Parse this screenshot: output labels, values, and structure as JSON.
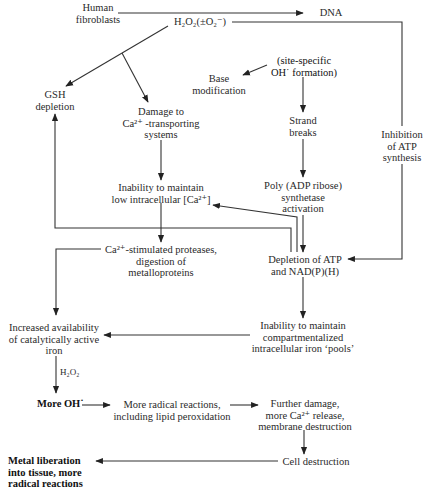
{
  "diagram": {
    "nodes": {
      "human_fibroblasts": [
        "Human",
        "fibroblasts"
      ],
      "h2o2": "H₂O₂(±O₂⁻)",
      "dna": "DNA",
      "gsh_depletion": [
        "GSH",
        "depletion"
      ],
      "damage_ca_transport": [
        "Damage to",
        "Ca²⁺ -transporting",
        "systems"
      ],
      "site_specific_oh": [
        "(site-specific",
        "OH˙ formation)"
      ],
      "base_modification": [
        "Base",
        "modification"
      ],
      "strand_breaks": [
        "Strand",
        "breaks"
      ],
      "inhibition_atp": [
        "Inhibition",
        "of ATP",
        "synthesis"
      ],
      "inability_ca": [
        "Inability to maintain",
        "low intracellular [Ca²⁺]"
      ],
      "poly_adp": [
        "Poly (ADP ribose)",
        "synthetase",
        "activation"
      ],
      "ca_proteases": [
        "Ca²⁺-stimulated proteases,",
        "digestion of",
        "metalloproteins"
      ],
      "depletion_atp": [
        "Depletion of ATP",
        "and NAD(P)(H)"
      ],
      "increased_iron": [
        "Increased availability",
        "of catalytically active",
        "iron"
      ],
      "inability_iron_pools": [
        "Inability to maintain",
        "compartmentalized",
        "intracellular iron ‘pools’"
      ],
      "more_oh": "More OH˙",
      "more_radical": [
        "More radical reactions,",
        "including lipid peroxidation"
      ],
      "further_damage": [
        "Further damage,",
        "more Ca²⁺ release,",
        "membrane destruction"
      ],
      "cell_destruction": "Cell destruction",
      "metal_liberation": [
        "Metal liberation",
        "into tissue, more",
        "radical reactions"
      ]
    },
    "edge_labels": {
      "h2o2_label": "H₂O₂"
    },
    "edges": [
      {
        "from": "human_fibroblasts",
        "to": "dna"
      },
      {
        "from": "h2o2",
        "to": "gsh_depletion"
      },
      {
        "from": "h2o2",
        "to": "damage_ca_transport"
      },
      {
        "from": "h2o2",
        "to": "inhibition_atp"
      },
      {
        "from": "site_specific_oh",
        "to": "base_modification"
      },
      {
        "from": "site_specific_oh",
        "to": "strand_breaks"
      },
      {
        "from": "strand_breaks",
        "to": "poly_adp"
      },
      {
        "from": "poly_adp",
        "to": "depletion_atp"
      },
      {
        "from": "inhibition_atp",
        "to": "depletion_atp"
      },
      {
        "from": "damage_ca_transport",
        "to": "inability_ca"
      },
      {
        "from": "inability_ca",
        "to": "ca_proteases"
      },
      {
        "from": "depletion_atp",
        "to": "inability_ca"
      },
      {
        "from": "depletion_atp",
        "to": "gsh_depletion"
      },
      {
        "from": "ca_proteases",
        "to": "increased_iron"
      },
      {
        "from": "depletion_atp",
        "to": "inability_iron_pools"
      },
      {
        "from": "inability_iron_pools",
        "to": "increased_iron"
      },
      {
        "from": "increased_iron",
        "to": "more_oh",
        "label": "H₂O₂"
      },
      {
        "from": "more_oh",
        "to": "more_radical"
      },
      {
        "from": "more_radical",
        "to": "further_damage"
      },
      {
        "from": "further_damage",
        "to": "cell_destruction"
      },
      {
        "from": "cell_destruction",
        "to": "metal_liberation"
      }
    ]
  }
}
